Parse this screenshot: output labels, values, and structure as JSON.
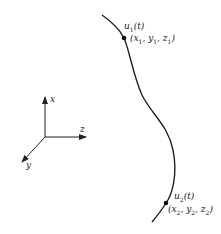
{
  "diagram": {
    "colors": {
      "stroke": "#222222",
      "background": "#ffffff"
    },
    "axes": {
      "x_label": "x",
      "y_label": "y",
      "z_label": "z"
    },
    "curve": {
      "points": [
        {
          "name": "u1",
          "label_main": "u",
          "label_sub": "1",
          "label_arg": "(t)",
          "coords_text": "(x1, y1, z1)",
          "coords": [
            "x",
            "1",
            "y",
            "1",
            "z",
            "1"
          ]
        },
        {
          "name": "u2",
          "label_main": "u",
          "label_sub": "2",
          "label_arg": "(t)",
          "coords_text": "(x2, y2, z2)",
          "coords": [
            "x",
            "2",
            "y",
            "2",
            "z",
            "2"
          ]
        }
      ]
    }
  }
}
